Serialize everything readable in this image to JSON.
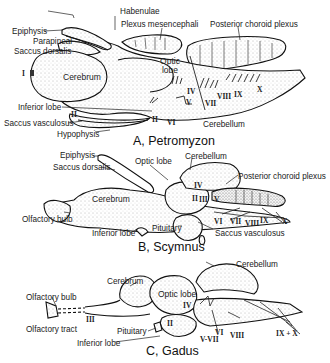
{
  "figure": {
    "panels": [
      {
        "caption": "A, Petromyzon",
        "labels": {
          "habenulae": "Habenulae",
          "epiphysis": "Epiphysis",
          "parapineal": "Parapineal",
          "saccus_dorsalis": "Saccus dorsalis",
          "plexus_mesencephali": "Plexus mesencephali",
          "posterior_choroid_plexus": "Posterior choroid plexus",
          "optic_lobe": "Optic lobe",
          "cerebrum": "Cerebrum",
          "inferior_lobe": "Inferior lobe",
          "saccus_vasculosus": "Saccus vasculosus",
          "hypophysis": "Hypophysis",
          "cerebellum": "Cerebellum"
        },
        "nerves": [
          "I",
          "II",
          "II",
          "IV",
          "V",
          "VI",
          "VII",
          "VIII",
          "IX",
          "X"
        ]
      },
      {
        "caption": "B, Scymnus",
        "labels": {
          "epiphysis": "Epiphysis",
          "saccus_dorsalis": "Saccus dorsalis",
          "optic_lobe": "Optic lobe",
          "cerebellum": "Cerebellum",
          "posterior_choroid_plexus": "Posterior choroid plexus",
          "cerebrum": "Cerebrum",
          "olfactory_bulb": "Olfactory bulb",
          "inferior_lobe": "Inferior lobe",
          "pituitary": "Pituitary",
          "saccus_vasculosus": "Saccus vasculosus"
        },
        "nerves": [
          "II",
          "III",
          "IV",
          "V",
          "VI",
          "VII",
          "VIII",
          "IX",
          "X"
        ]
      },
      {
        "caption": "C, Gadus",
        "labels": {
          "cerebrum": "Cerebrum",
          "cerebellum": "Cerebellum",
          "optic_lobe": "Optic lobe",
          "olfactory_bulb": "Olfactory bulb",
          "olfactory_tract": "Olfactory tract",
          "pituitary": "Pituitary",
          "inferior_lobe": "Inferior lobe"
        },
        "nerves": [
          "II",
          "III",
          "IV",
          "V-VII",
          "VI",
          "VIII",
          "IX + X"
        ]
      }
    ]
  }
}
